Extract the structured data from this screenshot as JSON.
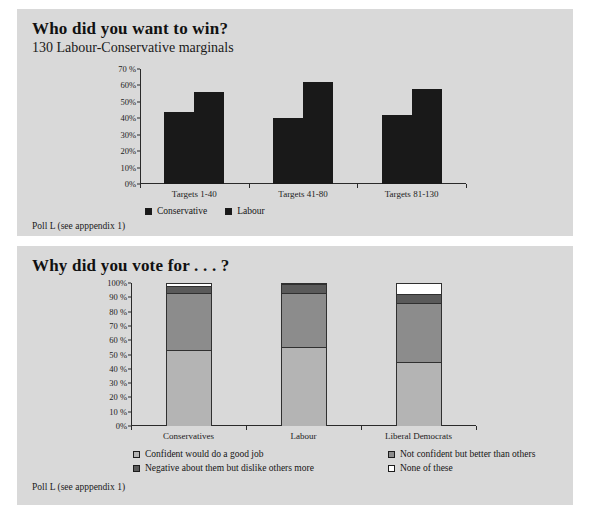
{
  "page": {
    "background": "#ffffff",
    "panel_background": "#d9d9d9"
  },
  "chart_data": [
    {
      "type": "bar",
      "title": "Who did you want to win?",
      "subtitle": "130 Labour-Conservative marginals",
      "caption": "Poll L (see apppendix 1)",
      "xlabel": "",
      "ylabel": "",
      "ylim": [
        0,
        70
      ],
      "grid": false,
      "legend_position": "bottom",
      "categories": [
        "Targets 1-40",
        "Targets 41-80",
        "Targets 81-130"
      ],
      "ytick_labels": [
        "0%",
        "10%",
        "20%",
        "30%",
        "40%",
        "50%",
        "60%",
        "70 %"
      ],
      "ytick_values": [
        0,
        10,
        20,
        30,
        40,
        50,
        60,
        70
      ],
      "series": [
        {
          "name": "Conservative",
          "color": "#191919",
          "values": [
            44,
            40,
            42
          ]
        },
        {
          "name": "Labour",
          "color": "#191919",
          "values": [
            56,
            62,
            58
          ]
        }
      ]
    },
    {
      "type": "bar",
      "stacked": true,
      "title": "Why did you vote for . . . ?",
      "subtitle": "",
      "caption": "Poll L (see apppendix 1)",
      "xlabel": "",
      "ylabel": "",
      "ylim": [
        0,
        100
      ],
      "grid": false,
      "legend_position": "bottom",
      "categories": [
        "Conservatives",
        "Labour",
        "Liberal Democrats"
      ],
      "ytick_labels": [
        "0%",
        "10 %",
        "20 %",
        "30 %",
        "40 %",
        "50 %",
        "60 %",
        "70 %",
        "80 %",
        "90 %",
        "100%"
      ],
      "ytick_values": [
        0,
        10,
        20,
        30,
        40,
        50,
        60,
        70,
        80,
        90,
        100
      ],
      "series": [
        {
          "name": "Confident would do a good job",
          "color": "#b4b4b4",
          "values": [
            53,
            55,
            45
          ]
        },
        {
          "name": "Not confident but better than others",
          "color": "#8c8c8c",
          "values": [
            40,
            38,
            41
          ]
        },
        {
          "name": "Negative about them but dislike others more",
          "color": "#5a5a5a",
          "values": [
            5,
            6,
            6
          ]
        },
        {
          "name": "None of these",
          "color": "#ffffff",
          "values": [
            2,
            1,
            8
          ]
        }
      ]
    }
  ]
}
